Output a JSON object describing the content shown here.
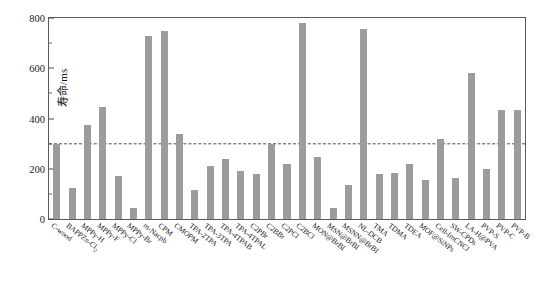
{
  "chart_data": {
    "type": "bar",
    "title": "",
    "xlabel": "",
    "ylabel": "寿命/ms",
    "ylim": [
      0,
      800
    ],
    "yticks": [
      0,
      200,
      400,
      600,
      800
    ],
    "yminorticks": [
      100,
      300,
      500,
      700
    ],
    "grid": false,
    "legend": "none",
    "bar_color": "#9c9c9c",
    "reference_line": {
      "value": 300,
      "style": "dashed",
      "color": "#4d4d4d"
    },
    "categories": [
      "C-wood",
      "BAPPZn-Cl2",
      "MPPy-H",
      "MPPy-F",
      "MPPy-Cl",
      "MPPy-Br",
      "m-Nacpb",
      "CPM",
      "CMOPM",
      "TPA-2TPA",
      "TPA-3TPA",
      "TPA-4TPAB",
      "TPA-4TPAL",
      "C2PBr",
      "C2BBr",
      "C2PCl",
      "C2BCl",
      "MON@BrBI",
      "MSN@BrBI",
      "MSNN@BrBI",
      "NL-DCB",
      "TMA",
      "TDMA",
      "TDEA",
      "MOF@SiNPs",
      "Cell-ImCNCl",
      "SW-CPDs",
      "LA-H@PVA",
      "PVP-S",
      "PVP-C",
      "PVP-B"
    ],
    "categories_display": [
      "C-wood",
      "BAPPZn-Cl₂",
      "MPPy-H",
      "MPPy-F",
      "MPPy-Cl",
      "MPPy-Br",
      "m-Nacpb",
      "CPM",
      "CMOPM",
      "TPA-2TPA",
      "TPA-3TPA",
      "TPA-4TPAB",
      "TPA-4TPAL",
      "C2PBr",
      "C2BBr",
      "C2PCl",
      "C2BCl",
      "MON@BrBI",
      "MSN@BrBI",
      "MSNN@BrBI",
      "NL-DCB",
      "TMA",
      "TDMA",
      "TDEA",
      "MOF@SiNPs",
      "Cell-ImCNCl",
      "SW-CPDs",
      "LA-H@PVA",
      "PVP-S",
      "PVP-C",
      "PVP-B"
    ],
    "values": [
      300,
      125,
      375,
      445,
      172,
      42,
      730,
      748,
      340,
      115,
      210,
      240,
      190,
      178,
      300,
      220,
      780,
      245,
      42,
      135,
      758,
      180,
      185,
      218,
      155,
      320,
      165,
      580,
      198,
      435,
      435
    ]
  },
  "axis": {
    "y_title": "寿命/ms",
    "y_tick_labels": [
      "0",
      "200",
      "400",
      "600",
      "800"
    ]
  },
  "caption": {
    "text": ""
  }
}
